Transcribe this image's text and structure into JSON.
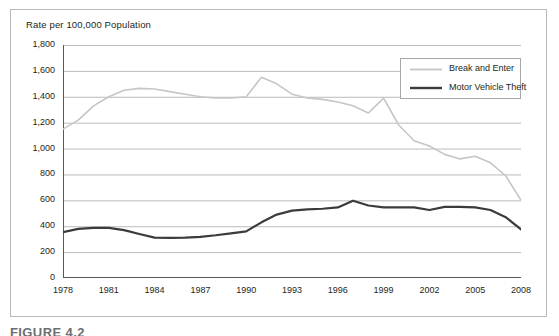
{
  "figure": {
    "caption": "FIGURE 4.2"
  },
  "legend": {
    "position": "top-right",
    "entries": [
      {
        "label": "Break and Enter",
        "color": "#c6c6c6",
        "width": 1.6
      },
      {
        "label": "Motor Vehicle Theft",
        "color": "#3b3b3d",
        "width": 2.2
      }
    ]
  },
  "chart_data": {
    "type": "line",
    "title": "Rate per 100,000 Population",
    "xlabel": "",
    "ylabel": "",
    "grid": true,
    "ylim": [
      0,
      1800
    ],
    "xlim": [
      1978,
      2008
    ],
    "ytick_labels": [
      "0",
      "200",
      "400",
      "600",
      "800",
      "1,000",
      "1,200",
      "1,400",
      "1,600",
      "1,800"
    ],
    "ytick_values": [
      0,
      200,
      400,
      600,
      800,
      1000,
      1200,
      1400,
      1600,
      1800
    ],
    "xtick_labels": [
      "1978",
      "1981",
      "1984",
      "1987",
      "1990",
      "1993",
      "1996",
      "1999",
      "2002",
      "2005",
      "2008"
    ],
    "xtick_values": [
      1978,
      1981,
      1984,
      1987,
      1990,
      1993,
      1996,
      1999,
      2002,
      2005,
      2008
    ],
    "x": [
      1978,
      1979,
      1980,
      1981,
      1982,
      1983,
      1984,
      1985,
      1986,
      1987,
      1988,
      1989,
      1990,
      1991,
      1992,
      1993,
      1994,
      1995,
      1996,
      1997,
      1998,
      1999,
      2000,
      2001,
      2002,
      2003,
      2004,
      2005,
      2006,
      2007,
      2008
    ],
    "series": [
      {
        "name": "Break and Enter",
        "color": "#c6c6c6",
        "values": [
          1150,
          1220,
          1330,
          1400,
          1450,
          1465,
          1460,
          1440,
          1420,
          1400,
          1390,
          1390,
          1400,
          1550,
          1500,
          1420,
          1390,
          1380,
          1360,
          1330,
          1275,
          1390,
          1180,
          1060,
          1020,
          955,
          920,
          940,
          890,
          790,
          600
        ]
      },
      {
        "name": "Motor Vehicle Theft",
        "color": "#3b3b3d",
        "values": [
          355,
          380,
          388,
          387,
          370,
          340,
          312,
          310,
          312,
          318,
          330,
          345,
          360,
          430,
          490,
          520,
          530,
          535,
          545,
          597,
          560,
          545,
          545,
          545,
          525,
          550,
          550,
          545,
          525,
          470,
          375
        ]
      }
    ]
  }
}
